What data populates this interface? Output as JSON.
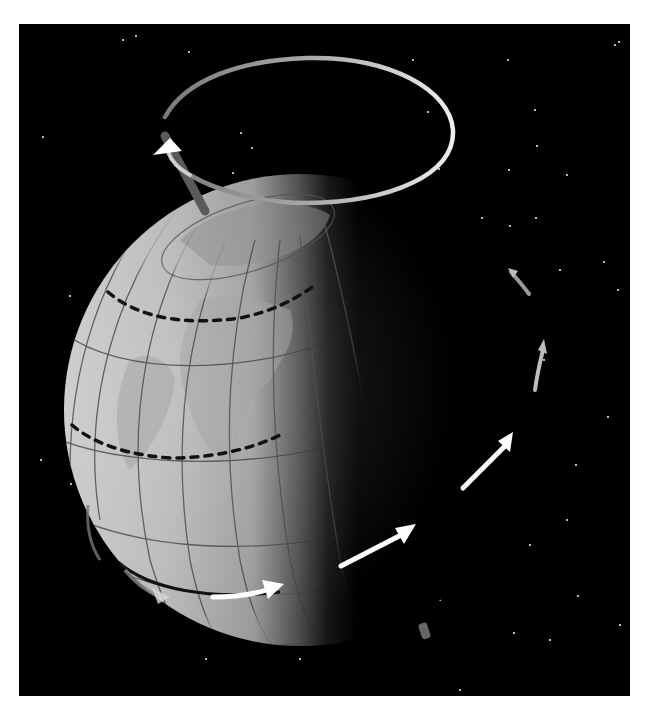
{
  "figure": {
    "background_color": "#000000",
    "page_color": "#ffffff",
    "panel": {
      "x": 19,
      "y": 24,
      "width": 611,
      "height": 672
    },
    "globe": {
      "cx": 300,
      "cy": 410,
      "r": 236,
      "lit_color": "#b4b4b4",
      "dark_color": "#000000"
    },
    "precession_ring": {
      "cx": 307,
      "cy": 130,
      "rx": 146,
      "ry": 73,
      "color_dim": "#8a8a8a",
      "color_bright": "#e8e8e8"
    },
    "axis_rod": {
      "x1": 163,
      "y1": 134,
      "x2": 205,
      "y2": 212,
      "color": "#5a5a5a"
    },
    "rotation_arrows_color": "#ffffff",
    "tropic_line_style": "dashed",
    "stars": [
      [
        123,
        40
      ],
      [
        136,
        36
      ],
      [
        189,
        52
      ],
      [
        251,
        65
      ],
      [
        413,
        60
      ],
      [
        508,
        60
      ],
      [
        615,
        45
      ],
      [
        619,
        42
      ],
      [
        428,
        112
      ],
      [
        535,
        110
      ],
      [
        241,
        133
      ],
      [
        252,
        148
      ],
      [
        43,
        137
      ],
      [
        233,
        173
      ],
      [
        439,
        169
      ],
      [
        537,
        146
      ],
      [
        509,
        170
      ],
      [
        567,
        175
      ],
      [
        482,
        218
      ],
      [
        560,
        270
      ],
      [
        618,
        290
      ],
      [
        604,
        262
      ],
      [
        536,
        218
      ],
      [
        70,
        296
      ],
      [
        608,
        417
      ],
      [
        576,
        465
      ],
      [
        567,
        520
      ],
      [
        41,
        460
      ],
      [
        71,
        484
      ],
      [
        530,
        545
      ],
      [
        578,
        596
      ],
      [
        550,
        640
      ],
      [
        460,
        690
      ],
      [
        620,
        625
      ],
      [
        514,
        633
      ],
      [
        440,
        600
      ],
      [
        206,
        659
      ],
      [
        300,
        659
      ],
      [
        544,
        360
      ],
      [
        510,
        226
      ]
    ]
  }
}
